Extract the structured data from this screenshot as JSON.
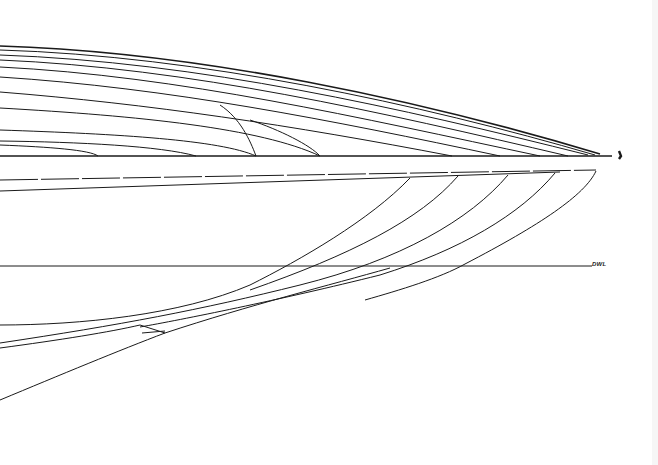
{
  "drawing": {
    "type": "hull lines plan (bow half-breadth and profile)",
    "background": "#ffffff",
    "line_color": "#1a1a1a",
    "labels": {
      "dwl": "DWL"
    },
    "half_breadth_plan": {
      "centerline_y": 156,
      "waterline_count": 11,
      "stem_tip_x": 620
    },
    "profile_plan": {
      "sheer_y": 172,
      "dwl_y": 266,
      "stem_top_x": 596,
      "buttock_count": 4
    }
  }
}
